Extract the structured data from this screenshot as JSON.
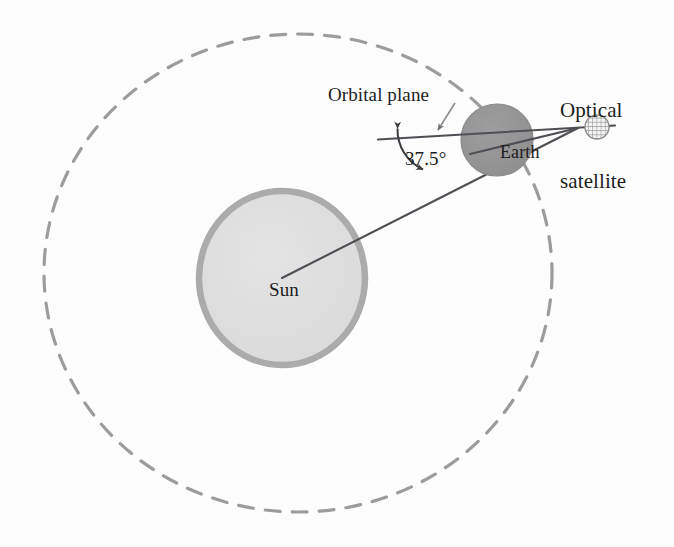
{
  "diagram": {
    "background_color": "#fdfdfd",
    "width": 674,
    "height": 547,
    "labels": {
      "optical_satellite_line1": "Optical",
      "optical_satellite_line2": "satellite",
      "orbital_plane": "Orbital plane",
      "earth": "Earth",
      "sun": "Sun",
      "angle": "37.5°"
    },
    "objects": {
      "sun": {
        "name": "Sun",
        "center_x": 282,
        "center_y": 278,
        "radius_x": 86,
        "radius_y": 90,
        "fill_color": "#dedede",
        "stroke_color": "#a9a9a9",
        "stroke_width": 6
      },
      "earth": {
        "name": "Earth",
        "center_x": 497,
        "center_y": 140,
        "radius": 36,
        "fill_color": "#969696",
        "stroke_color": "#8c8c8c"
      },
      "satellite": {
        "name": "Optical satellite",
        "center_x": 597,
        "center_y": 127,
        "radius": 12,
        "fill_color": "#f2f2f2",
        "stroke_color": "#8d8d8d",
        "pattern": "cross-hatch-grid"
      },
      "orbit": {
        "name": "Earth orbit around Sun",
        "center_x": 298,
        "center_y": 273,
        "radius_x": 254,
        "radius_y": 239,
        "stroke_color": "#9b9b9b",
        "stroke_width": 3,
        "dash": "14 11",
        "style": "dashed"
      },
      "orbital_plane_line": {
        "name": "Orbital plane reference line",
        "x1": 378,
        "y1": 139,
        "x2": 614,
        "y2": 126,
        "stroke_color": "#4c4c52",
        "stroke_width": 2
      },
      "sun_earth_line": {
        "name": "Sun to satellite sight line",
        "x1": 282,
        "y1": 278,
        "x2": 575,
        "y2": 128,
        "stroke_color": "#4c4c52",
        "stroke_width": 2
      },
      "angle_arc": {
        "name": "37.5 degree angle arc",
        "value": "37.5°",
        "vertex_x": 386,
        "vertex_y": 139,
        "stroke_color": "#3a3a40",
        "arrowheads": "both"
      },
      "orbital_plane_leader": {
        "name": "Orbital plane leader line",
        "x1": 454,
        "y1": 105,
        "x2": 440,
        "y2": 130,
        "stroke_color": "#8d8d92"
      }
    }
  }
}
